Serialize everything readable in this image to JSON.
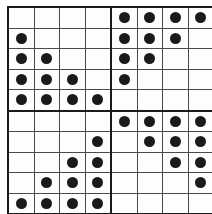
{
  "figure": {
    "dot_glyph": "filled-circle"
  },
  "colors": {
    "background": "#ffffff",
    "cell_fill": "#fdfdfd",
    "grid_line": "#4a4a4a",
    "heavy_line": "#1a1a1a",
    "dot": "#1a1a1a"
  },
  "grid": {
    "columns": 8,
    "rows": 10,
    "quadrant_columns": 4,
    "quadrant_rows": 5,
    "heavy_divider_after_column": 4,
    "heavy_divider_after_row": 5
  },
  "quadrants": [
    {
      "name": "top-left",
      "pattern": "lower-left-triangle",
      "alignment": "left",
      "dot_counts_by_row": [
        0,
        1,
        2,
        3,
        4
      ]
    },
    {
      "name": "top-right",
      "pattern": "upper-left-triangle",
      "alignment": "left",
      "dot_counts_by_row": [
        4,
        3,
        2,
        1,
        0
      ]
    },
    {
      "name": "bottom-left",
      "pattern": "lower-right-triangle",
      "alignment": "right",
      "dot_counts_by_row": [
        0,
        1,
        2,
        3,
        4
      ]
    },
    {
      "name": "bottom-right",
      "pattern": "upper-right-triangle",
      "alignment": "right",
      "dot_counts_by_row": [
        4,
        3,
        2,
        1,
        0
      ]
    }
  ],
  "chart_data": {
    "type": "heatmap",
    "xlabel": "",
    "ylabel": "",
    "columns": 8,
    "rows": 10,
    "legend": [],
    "grid": true,
    "cells": [
      [
        0,
        0,
        0,
        0,
        1,
        1,
        1,
        1
      ],
      [
        1,
        0,
        0,
        0,
        1,
        1,
        1,
        0
      ],
      [
        1,
        1,
        0,
        0,
        1,
        1,
        0,
        0
      ],
      [
        1,
        1,
        1,
        0,
        1,
        0,
        0,
        0
      ],
      [
        1,
        1,
        1,
        1,
        0,
        0,
        0,
        0
      ],
      [
        0,
        0,
        0,
        0,
        1,
        1,
        1,
        1
      ],
      [
        0,
        0,
        0,
        1,
        0,
        1,
        1,
        1
      ],
      [
        0,
        0,
        1,
        1,
        0,
        0,
        1,
        1
      ],
      [
        0,
        1,
        1,
        1,
        0,
        0,
        0,
        1
      ],
      [
        1,
        1,
        1,
        1,
        0,
        0,
        0,
        0
      ]
    ],
    "row_dot_totals": [
      4,
      4,
      4,
      4,
      4,
      4,
      4,
      4,
      4,
      4
    ],
    "column_dot_totals": [
      5,
      5,
      5,
      5,
      5,
      5,
      5,
      5
    ],
    "total_dots": 40
  }
}
